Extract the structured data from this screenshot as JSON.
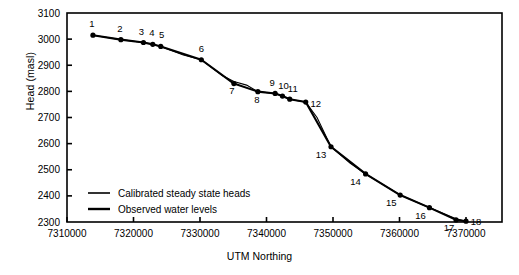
{
  "chart_data": {
    "type": "line",
    "title": "",
    "xlabel": "UTM Northing",
    "ylabel": "Head (masl)",
    "xlim": [
      7310000,
      7372000
    ],
    "ylim": [
      2300,
      3100
    ],
    "xticks": [
      "7310000",
      "7320000",
      "7330000",
      "7340000",
      "7350000",
      "7360000",
      "7370000"
    ],
    "xtick_values": [
      7310000,
      7320000,
      7330000,
      7340000,
      7350000,
      7360000,
      7370000
    ],
    "yticks": [
      "2300",
      "2400",
      "2500",
      "2600",
      "2700",
      "2800",
      "2900",
      "3000",
      "3100"
    ],
    "ytick_values": [
      2300,
      2400,
      2500,
      2600,
      2700,
      2800,
      2900,
      3000,
      3100
    ],
    "grid": false,
    "legend_position": "lower-left",
    "legend": [
      "Calibrated steady state heads",
      "Observed water levels"
    ],
    "point_labels": [
      "1",
      "2",
      "3",
      "4",
      "5",
      "6",
      "7",
      "8",
      "9",
      "10",
      "11",
      "12",
      "13",
      "14",
      "15",
      "16",
      "17",
      "18"
    ],
    "series": [
      {
        "name": "Observed water levels",
        "marker": "filled-circle",
        "x": [
          7313900,
          7318100,
          7321500,
          7322900,
          7324100,
          7330200,
          7335100,
          7338700,
          7341300,
          7342400,
          7343500,
          7345900,
          7349700,
          7354900,
          7360100,
          7364500,
          7368500,
          7370000
        ],
        "values": [
          3015,
          2998,
          2987,
          2980,
          2972,
          2921,
          2830,
          2799,
          2792,
          2782,
          2770,
          2759,
          2588,
          2484,
          2403,
          2355,
          2308,
          2303
        ]
      },
      {
        "name": "Calibrated steady state heads",
        "marker": "none",
        "x": [
          7313900,
          7318100,
          7321500,
          7322900,
          7324100,
          7327500,
          7330200,
          7333400,
          7335100,
          7337000,
          7338700,
          7341300,
          7342400,
          7343500,
          7345900,
          7347600,
          7349700,
          7352600,
          7354900,
          7360100,
          7364500,
          7368500,
          7370000
        ],
        "values": [
          3015,
          2998,
          2987,
          2980,
          2972,
          2939,
          2921,
          2860,
          2838,
          2824,
          2799,
          2792,
          2782,
          2770,
          2759,
          2700,
          2588,
          2525,
          2484,
          2403,
          2355,
          2312,
          2303
        ]
      }
    ]
  }
}
